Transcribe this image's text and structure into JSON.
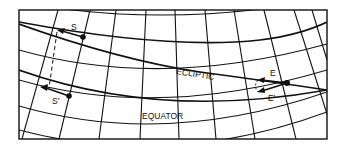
{
  "diagram": {
    "type": "celestial-coordinate-grid",
    "labels": {
      "ecliptic": "ECLIPTIC",
      "equator": "EQUATOR",
      "star_s": "S",
      "star_s_prime": "S'",
      "star_e": "E",
      "star_e_prime": "E'"
    },
    "colors": {
      "ink": "#111111",
      "background": "#ffffff"
    },
    "elements": [
      {
        "name": "frame",
        "description": "rectangular border"
      },
      {
        "name": "parallels",
        "description": "curved declination lines"
      },
      {
        "name": "meridians",
        "description": "slanted hour circles"
      },
      {
        "name": "ecliptic",
        "description": "curve crossing equator"
      },
      {
        "name": "point-s",
        "description": "star S with arrow pointing left"
      },
      {
        "name": "point-s-prime",
        "description": "projected S' with arrow, joined by dashed line"
      },
      {
        "name": "point-e",
        "description": "point E on ecliptic with arrows E and E'"
      }
    ]
  }
}
